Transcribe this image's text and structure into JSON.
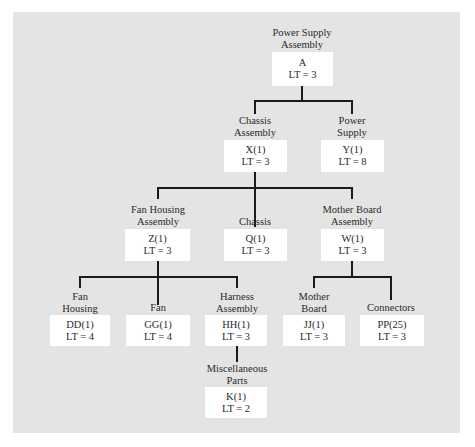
{
  "diagram": {
    "nodes": [
      {
        "id": "A",
        "name_lines": [
          "Power Supply",
          "Assembly"
        ],
        "code": "A",
        "lead_time": "LT = 3"
      },
      {
        "id": "X",
        "name_lines": [
          "Chassis",
          "Assembly"
        ],
        "code": "X(1)",
        "lead_time": "LT = 3"
      },
      {
        "id": "Y",
        "name_lines": [
          "Power",
          "Supply"
        ],
        "code": "Y(1)",
        "lead_time": "LT = 8"
      },
      {
        "id": "Z",
        "name_lines": [
          "Fan Housing",
          "Assembly"
        ],
        "code": "Z(1)",
        "lead_time": "LT = 3"
      },
      {
        "id": "Q",
        "name_lines": [
          "Chassis"
        ],
        "code": "Q(1)",
        "lead_time": "LT = 3"
      },
      {
        "id": "W",
        "name_lines": [
          "Mother Board",
          "Assembly"
        ],
        "code": "W(1)",
        "lead_time": "LT = 3"
      },
      {
        "id": "DD",
        "name_lines": [
          "Fan",
          "Housing"
        ],
        "code": "DD(1)",
        "lead_time": "LT = 4"
      },
      {
        "id": "GG",
        "name_lines": [
          "Fan"
        ],
        "code": "GG(1)",
        "lead_time": "LT = 4"
      },
      {
        "id": "HH",
        "name_lines": [
          "Harness",
          "Assembly"
        ],
        "code": "HH(1)",
        "lead_time": "LT = 3"
      },
      {
        "id": "JJ",
        "name_lines": [
          "Mother",
          "Board"
        ],
        "code": "JJ(1)",
        "lead_time": "LT = 3"
      },
      {
        "id": "PP",
        "name_lines": [
          "Connectors"
        ],
        "code": "PP(25)",
        "lead_time": "LT = 3"
      },
      {
        "id": "K",
        "name_lines": [
          "Miscellaneous",
          "Parts"
        ],
        "code": "K(1)",
        "lead_time": "LT = 2"
      }
    ],
    "edges": [
      [
        "A",
        "X"
      ],
      [
        "A",
        "Y"
      ],
      [
        "X",
        "Z"
      ],
      [
        "X",
        "Q"
      ],
      [
        "X",
        "W"
      ],
      [
        "Z",
        "DD"
      ],
      [
        "Z",
        "GG"
      ],
      [
        "Z",
        "HH"
      ],
      [
        "W",
        "JJ"
      ],
      [
        "W",
        "PP"
      ],
      [
        "HH",
        "K"
      ]
    ]
  }
}
